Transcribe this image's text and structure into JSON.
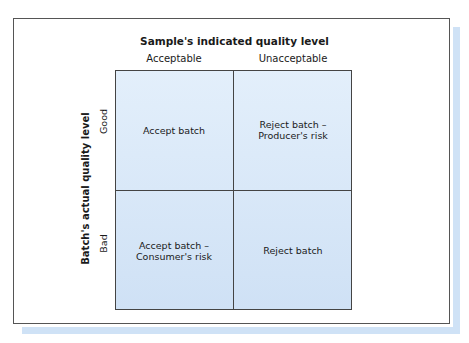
{
  "diagram": {
    "title": "Sample's indicated quality level",
    "columns": [
      "Acceptable",
      "Unacceptable"
    ],
    "y_axis_title": "Batch's actual quality level",
    "rows": [
      "Good",
      "Bad"
    ],
    "cells": [
      [
        "Accept batch",
        "Reject batch –\nProducer's risk"
      ],
      [
        "Accept batch –\nConsumer's risk",
        "Reject batch"
      ]
    ],
    "cell_lines": {
      "good_acceptable": [
        "Accept batch"
      ],
      "good_unacceptable": [
        "Reject batch –",
        "Producer's risk"
      ],
      "bad_acceptable": [
        "Accept batch –",
        "Consumer's risk"
      ],
      "bad_unacceptable": [
        "Reject batch"
      ]
    },
    "colors": {
      "cell_fill": "#d6e6f8",
      "border": "#444444",
      "shadow": "#cfe2f6"
    }
  }
}
